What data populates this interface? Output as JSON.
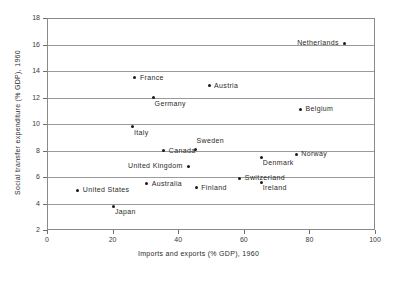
{
  "chart_data": {
    "type": "scatter",
    "title": "",
    "xlabel": "Imports and exports (% GDP), 1960",
    "ylabel": "Social transfer expenditure (% GDP), 1960",
    "xlim": [
      0,
      100
    ],
    "ylim": [
      2,
      18
    ],
    "xticks": [
      0,
      20,
      40,
      60,
      80,
      100
    ],
    "yticks": [
      2,
      4,
      6,
      8,
      10,
      12,
      14,
      16,
      18
    ],
    "grid": "horizontal",
    "legend": "none",
    "point_color": "#1a1a1a",
    "points": [
      {
        "label": "Netherlands",
        "x": 90.6,
        "y": 16.1,
        "label_side": "left"
      },
      {
        "label": "France",
        "x": 26.8,
        "y": 13.5,
        "label_side": "right"
      },
      {
        "label": "Austria",
        "x": 49.4,
        "y": 12.9,
        "label_side": "right"
      },
      {
        "label": "Germany",
        "x": 32.5,
        "y": 12.0,
        "label_side": "below-right"
      },
      {
        "label": "Belgium",
        "x": 77.3,
        "y": 11.1,
        "label_side": "right"
      },
      {
        "label": "Italy",
        "x": 26.2,
        "y": 9.8,
        "label_side": "below-right"
      },
      {
        "label": "Sweden",
        "x": 45.3,
        "y": 8.1,
        "label_side": "above-right"
      },
      {
        "label": "Canada",
        "x": 35.6,
        "y": 8.0,
        "label_side": "right"
      },
      {
        "label": "Norway",
        "x": 76.0,
        "y": 7.7,
        "label_side": "right"
      },
      {
        "label": "Denmark",
        "x": 65.5,
        "y": 7.5,
        "label_side": "below-right"
      },
      {
        "label": "United Kingdom",
        "x": 43.0,
        "y": 6.8,
        "label_side": "left"
      },
      {
        "label": "Switzerland",
        "x": 58.8,
        "y": 5.9,
        "label_side": "right"
      },
      {
        "label": "Ireland",
        "x": 65.5,
        "y": 5.6,
        "label_side": "below-right"
      },
      {
        "label": "Australia",
        "x": 30.4,
        "y": 5.5,
        "label_side": "right"
      },
      {
        "label": "Finland",
        "x": 45.5,
        "y": 5.2,
        "label_side": "right"
      },
      {
        "label": "United States",
        "x": 9.4,
        "y": 5.0,
        "label_side": "right"
      },
      {
        "label": "Japan",
        "x": 20.4,
        "y": 3.8,
        "label_side": "below-right"
      }
    ]
  }
}
